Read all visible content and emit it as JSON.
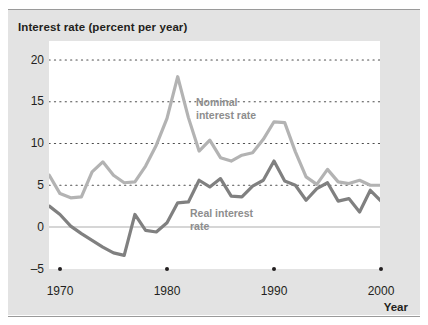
{
  "figure": {
    "y_axis_title": "Interest rate (percent per year)",
    "x_axis_title": "Year"
  },
  "labels": {
    "nominal": "Nominal\ninterest rate",
    "real": "Real interest\nrate"
  },
  "axes": {
    "y_ticks": [
      "20",
      "15",
      "10",
      "5",
      "0",
      "–5"
    ],
    "x_ticks": [
      "1970",
      "1980",
      "1990",
      "2000"
    ]
  },
  "colors": {
    "nominal_line": "#b3b3b3",
    "real_line": "#808080",
    "panel_background": "#e3e3e3",
    "plot_background": "#ffffff",
    "gridline": "#4d4d4d",
    "zero_line": "#c9c9c9",
    "text": "#231f20",
    "label_text": "#8d8d8d"
  },
  "chart_data": {
    "type": "line",
    "title": "",
    "xlabel": "Year",
    "ylabel": "Interest rate (percent per year)",
    "xlim": [
      1969,
      2001
    ],
    "ylim": [
      -5,
      20
    ],
    "yticks": [
      -5,
      0,
      5,
      10,
      15,
      20
    ],
    "xticks": [
      1970,
      1980,
      1990,
      2000
    ],
    "grid": "horizontal-dotted",
    "legend": "inline-annotations",
    "x": [
      1969,
      1970,
      1971,
      1972,
      1973,
      1974,
      1975,
      1976,
      1977,
      1978,
      1979,
      1980,
      1981,
      1982,
      1983,
      1984,
      1985,
      1986,
      1987,
      1988,
      1989,
      1990,
      1991,
      1992,
      1993,
      1994,
      1995,
      1996,
      1997,
      1998,
      1999,
      2000,
      2001
    ],
    "series": [
      {
        "name": "Nominal interest rate",
        "values": [
          6.2,
          4.0,
          3.5,
          3.6,
          6.6,
          7.8,
          6.2,
          5.3,
          5.4,
          7.3,
          9.8,
          13.0,
          18.0,
          13.1,
          9.1,
          10.4,
          8.3,
          7.9,
          8.6,
          8.9,
          10.5,
          12.6,
          12.5,
          9.0,
          6.0,
          5.1,
          6.9,
          5.4,
          5.2,
          5.6,
          5.0,
          5.0,
          5.8
        ]
      },
      {
        "name": "Real interest rate",
        "values": [
          2.5,
          1.5,
          0.1,
          -0.8,
          -1.6,
          -2.4,
          -3.1,
          -3.4,
          1.5,
          -0.4,
          -0.6,
          0.5,
          2.9,
          3.0,
          5.6,
          4.8,
          5.8,
          3.7,
          3.6,
          4.9,
          5.6,
          7.9,
          5.5,
          5.0,
          3.2,
          4.6,
          5.3,
          3.1,
          3.4,
          1.8,
          4.4,
          3.1,
          3.2
        ]
      }
    ]
  }
}
